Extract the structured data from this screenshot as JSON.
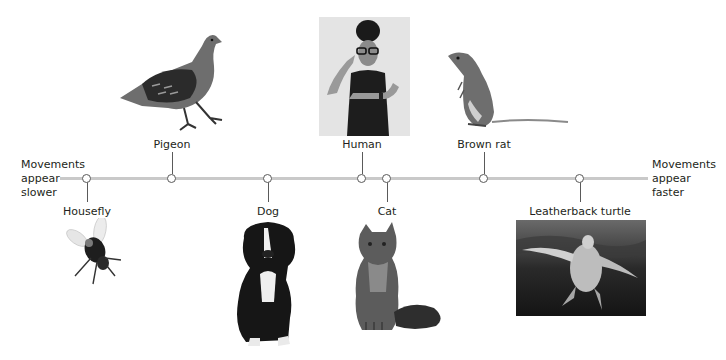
{
  "diagram": {
    "axis": {
      "left_label": [
        "Movements",
        "appear",
        "slower"
      ],
      "right_label": [
        "Movements",
        "appear",
        "faster"
      ],
      "line_color": "#c9c9c9"
    },
    "species": [
      {
        "label": "Housefly",
        "node_x": 87,
        "position": "below",
        "image": "housefly-photo"
      },
      {
        "label": "Pigeon",
        "node_x": 172,
        "position": "above",
        "image": "pigeon-photo"
      },
      {
        "label": "Dog",
        "node_x": 268,
        "position": "below",
        "image": "dog-photo"
      },
      {
        "label": "Human",
        "node_x": 362,
        "position": "above",
        "image": "human-photo"
      },
      {
        "label": "Cat",
        "node_x": 387,
        "position": "below",
        "image": "cat-photo"
      },
      {
        "label": "Brown rat",
        "node_x": 484,
        "position": "above",
        "image": "brown-rat-photo"
      },
      {
        "label": "Leatherback turtle",
        "node_x": 580,
        "position": "below",
        "image": "leatherback-turtle-photo"
      }
    ]
  }
}
